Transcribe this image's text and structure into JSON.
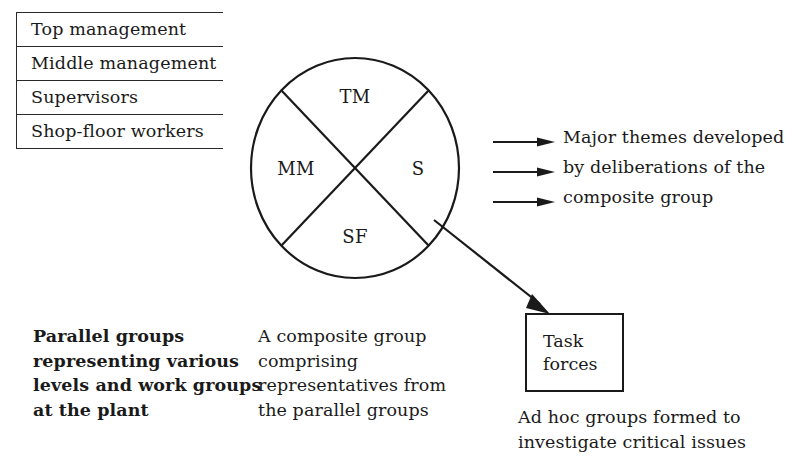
{
  "levels_table": {
    "name": "organisational-levels",
    "rows": [
      {
        "label": "Top management"
      },
      {
        "label": "Middle management"
      },
      {
        "label": "Supervisors"
      },
      {
        "label": "Shop-floor workers"
      }
    ]
  },
  "circle": {
    "name": "composite-group-circle",
    "segments": {
      "top": "TM",
      "left": "MM",
      "right": "S",
      "bottom": "SF"
    }
  },
  "themes": {
    "arrow_count": 3,
    "lines": [
      "Major themes developed",
      "by deliberations of the",
      "composite group"
    ]
  },
  "task_forces_box": {
    "lines": [
      "Task",
      "forces"
    ]
  },
  "captions": {
    "parallel": [
      "Parallel groups",
      "representing various",
      "levels and work groups",
      "at the plant"
    ],
    "composite": [
      "A composite group",
      "comprising",
      "representatives from",
      "the parallel groups"
    ],
    "adhoc": [
      "Ad hoc groups formed to",
      "investigate critical issues"
    ]
  },
  "colors": {
    "ink": "#1a1a1a",
    "rule": "#2a2a2a",
    "background": "#ffffff"
  }
}
